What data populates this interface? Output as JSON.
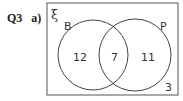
{
  "question": {
    "number": "Q3",
    "part": "a)"
  },
  "venn": {
    "universal_symbol": "ξ",
    "sets": [
      {
        "label": "B",
        "only": "12"
      },
      {
        "label": "P",
        "only": "11"
      }
    ],
    "intersection": "7",
    "outside": "3",
    "colors": {
      "line": "#444444",
      "text": "#333333",
      "background": "#ffffff"
    }
  }
}
